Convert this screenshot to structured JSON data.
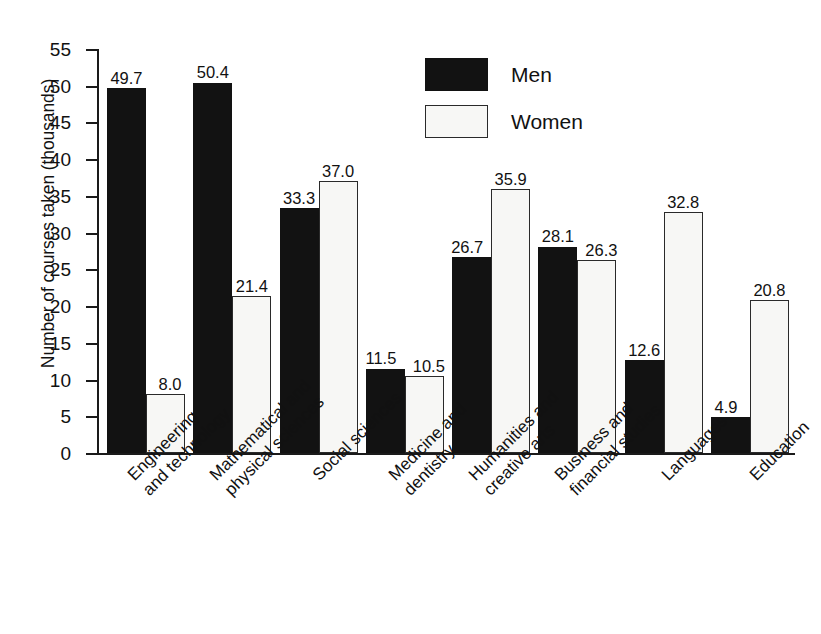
{
  "chart_data": {
    "type": "bar",
    "title": "",
    "subtitle": "",
    "xlabel": "",
    "ylabel": "Number of courses taken (thousands)",
    "ylim": [
      0,
      55
    ],
    "ytick_step": 5,
    "yticks": [
      "55",
      "50",
      "45",
      "40",
      "35",
      "30",
      "25",
      "20",
      "15",
      "10",
      "5",
      "0"
    ],
    "grid": false,
    "legend_position": "top-center",
    "categories": [
      "Engineering and technology",
      "Mathematical and physical sciences",
      "Social sciences",
      "Medicine and dentistry",
      "Humanities and creative arts",
      "Business and financial studies",
      "Languages",
      "Education"
    ],
    "category_lines": [
      [
        "Engineering",
        "and technology"
      ],
      [
        "Mathematical and",
        "physical sciences"
      ],
      [
        "Social sciences"
      ],
      [
        "Medicine and",
        "dentistry"
      ],
      [
        "Humanities and",
        "creative arts"
      ],
      [
        "Business and",
        "financial studies"
      ],
      [
        "Languages"
      ],
      [
        "Education"
      ]
    ],
    "series": [
      {
        "name": "Men",
        "color": "#121212",
        "values": [
          49.7,
          50.4,
          33.3,
          11.5,
          26.7,
          28.1,
          12.6,
          4.9
        ],
        "labels": [
          "49.7",
          "50.4",
          "33.3",
          "11.5",
          "26.7",
          "28.1",
          "12.6",
          "4.9"
        ]
      },
      {
        "name": "Women",
        "color": "#f7f7f5",
        "values": [
          8.0,
          21.4,
          37.0,
          10.5,
          35.9,
          26.3,
          32.8,
          20.8
        ],
        "labels": [
          "8.0",
          "21.4",
          "37.0",
          "10.5",
          "35.9",
          "26.3",
          "32.8",
          "20.8"
        ]
      }
    ]
  },
  "legend": {
    "items": [
      {
        "label": "Men",
        "swatch": "men"
      },
      {
        "label": "Women",
        "swatch": "women"
      }
    ]
  }
}
